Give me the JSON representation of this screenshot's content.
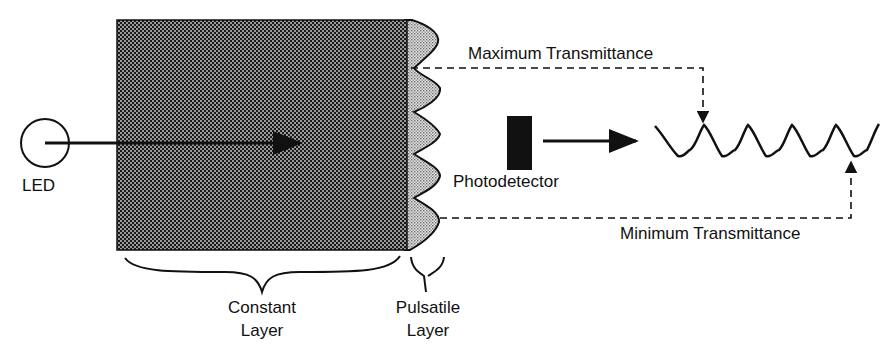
{
  "diagram": {
    "labels": {
      "led": "LED",
      "constant_layer_line1": "Constant",
      "constant_layer_line2": "Layer",
      "pulsatile_layer_line1": "Pulsatile",
      "pulsatile_layer_line2": "Layer",
      "photodetector": "Photodetector",
      "max_transmittance": "Maximum Transmittance",
      "min_transmittance": "Minimum Transmittance"
    },
    "nodes": [
      {
        "id": "led",
        "shape": "circle",
        "label": "LED"
      },
      {
        "id": "constant_layer",
        "shape": "hatched-rectangle",
        "label": "Constant Layer"
      },
      {
        "id": "pulsatile_layer",
        "shape": "wavy-stippled-band",
        "label": "Pulsatile Layer"
      },
      {
        "id": "photodetector",
        "shape": "filled-rectangle",
        "label": "Photodetector"
      },
      {
        "id": "waveform",
        "shape": "sine-wave",
        "label": ""
      }
    ],
    "edges": [
      {
        "from": "led",
        "to": "constant_layer",
        "style": "solid-arrow"
      },
      {
        "from": "photodetector",
        "to": "waveform",
        "style": "solid-arrow"
      },
      {
        "from": "pulsatile_layer",
        "to": "waveform",
        "style": "dashed-arrow",
        "label": "Maximum Transmittance",
        "target": "peak"
      },
      {
        "from": "pulsatile_layer",
        "to": "waveform",
        "style": "dashed-arrow",
        "label": "Minimum Transmittance",
        "target": "trough"
      }
    ],
    "colors": {
      "constant_fill": "#2b2b2b",
      "pulsatile_fill": "#bdbdbd",
      "stroke": "#111111",
      "detector": "#111111"
    },
    "caption": ""
  }
}
